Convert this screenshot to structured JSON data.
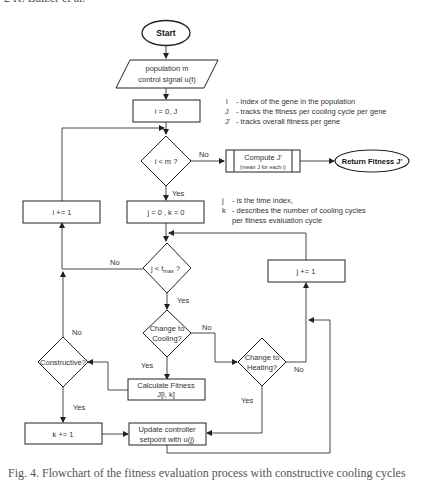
{
  "page": {
    "header_clipped": "2        K. Balzer et al.",
    "caption_clipped": "Fig. 4. Flowchart of the fitness evaluation process with constructive cooling cycles"
  },
  "nodes": {
    "start": "Start",
    "input_line1": "population m",
    "input_line2": "control signal u(t)",
    "init_i": "i = 0, J",
    "cond_i": "i < m ?",
    "compute_line1": "Compute J'",
    "compute_line2": "(mean J for each i)",
    "return": "Return Fitness J'",
    "inc_i": "i += 1",
    "init_jk": "j = 0 , k = 0",
    "cond_j": "j < t",
    "cond_j_sub": "max",
    "cond_j_q": " ?",
    "inc_j": "j += 1",
    "cooling_line1": "Change to",
    "cooling_line2": "Cooling?",
    "heating_line1": "Change to",
    "heating_line2": "Heating?",
    "constructive": "Constructive?",
    "calc_line1": "Calculate Fitness",
    "calc_line2": "J[i, k]",
    "inc_k": "k += 1",
    "update_line1": "Update controller",
    "update_line2": "setpoint with u(j)"
  },
  "edge_labels": {
    "cond_i_no": "No",
    "cond_i_yes": "Yes",
    "cond_j_no": "No",
    "cond_j_yes": "Yes",
    "cooling_no": "No",
    "cooling_yes": "Yes",
    "heating_no": "No",
    "heating_yes": "Yes",
    "constructive_no": "No",
    "constructive_yes": "Yes"
  },
  "legend_top": [
    {
      "sym": "i",
      "desc": "- index of the gene in the population"
    },
    {
      "sym": "J",
      "desc": "- tracks the fitness per cooling cycle per gene"
    },
    {
      "sym": "J'",
      "desc": "- tracks overall fitness per gene"
    }
  ],
  "legend_mid": [
    {
      "sym": "j",
      "desc": "- is the time index,"
    },
    {
      "sym": "k",
      "desc": "- describes the number of cooling cycles"
    },
    {
      "sym": "",
      "desc": "per fitness evaluation cycle"
    }
  ]
}
